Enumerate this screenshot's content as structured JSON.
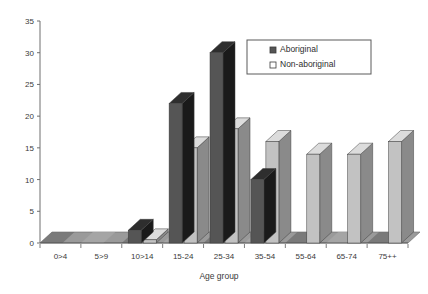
{
  "chart_data": {
    "type": "bar",
    "title": "",
    "subtitle": "",
    "xlabel": "Age group",
    "ylabel": "",
    "categories": [
      "0>4",
      "5>9",
      "10>14",
      "15-24",
      "25-34",
      "35-54",
      "55-64",
      "65-74",
      "75++"
    ],
    "series": [
      {
        "name": "Aboriginal",
        "values": [
          0,
          0,
          2,
          22,
          30,
          10,
          0,
          0,
          0
        ],
        "color": "#555555",
        "side_color": "#1a1a1a",
        "top_color": "#2e2e2e"
      },
      {
        "name": "Non-aboriginal",
        "values": [
          0,
          0,
          0.5,
          15,
          18,
          16,
          14,
          14,
          16
        ],
        "color": "#c2c2c2",
        "side_color": "#8a8a8a",
        "top_color": "#dcdcdc"
      }
    ],
    "ylim": [
      0,
      35
    ],
    "yticks": [
      0,
      5,
      10,
      15,
      20,
      25,
      30,
      35
    ],
    "ytick_labels": [
      "0",
      "5",
      "10",
      "15",
      "20",
      "25",
      "30",
      "35"
    ],
    "grid": false,
    "style": "3d-columns",
    "legend": {
      "position": "top-right",
      "entries": [
        {
          "label": "Aboriginal",
          "marker": "filled-square",
          "color": "#555555"
        },
        {
          "label": "Non-aboriginal",
          "marker": "open-square",
          "color": "#ffffff"
        }
      ]
    },
    "axis_color": "#6e6e6e",
    "floor_color": "#8f8f8f"
  }
}
